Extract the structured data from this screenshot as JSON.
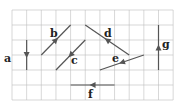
{
  "diagram": {
    "title": "",
    "grid": {
      "cols": 11,
      "rows": 6,
      "x0": 12,
      "y0": 10,
      "cell_w": 14.65,
      "cell_h": 15,
      "color": "#bdbdbd"
    },
    "vector_color": "#555555",
    "vectors": [
      {
        "label": "a",
        "from": [
          1,
          2
        ],
        "to": [
          1,
          4
        ],
        "label_pos": [
          4,
          62
        ]
      },
      {
        "label": "b",
        "from": [
          2,
          3
        ],
        "to": [
          4,
          1
        ],
        "label_pos": [
          50,
          37
        ]
      },
      {
        "label": "c",
        "from": [
          5,
          2
        ],
        "to": [
          3,
          4
        ],
        "label_pos": [
          71,
          64
        ]
      },
      {
        "label": "d",
        "from": [
          5,
          1
        ],
        "to": [
          8,
          3
        ],
        "arrow_toward": "from",
        "label_pos": [
          104,
          37
        ]
      },
      {
        "label": "e",
        "from": [
          9,
          3
        ],
        "to": [
          6,
          4
        ],
        "label_pos": [
          112,
          62
        ]
      },
      {
        "label": "f",
        "from": [
          7,
          5
        ],
        "to": [
          4,
          5
        ],
        "label_pos": [
          88,
          98
        ]
      },
      {
        "label": "g",
        "from": [
          10,
          4
        ],
        "to": [
          10,
          1
        ],
        "label_pos": [
          162,
          48
        ]
      }
    ]
  }
}
